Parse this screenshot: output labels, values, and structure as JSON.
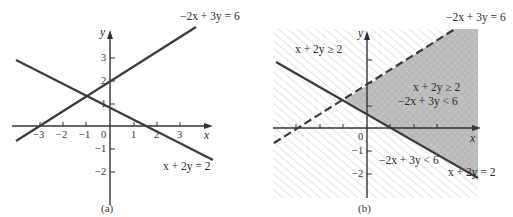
{
  "panels": [
    {
      "id": "a",
      "caption": "(a)",
      "axis_labels": {
        "x": "x",
        "y": "y"
      },
      "x_ticks": [
        "−3",
        "−2",
        "−1",
        "0",
        "1",
        "2",
        "3"
      ],
      "y_ticks": [
        "3",
        "2",
        "1",
        "−1",
        "−2"
      ],
      "lines": [
        {
          "equation": "−2x + 3y = 6",
          "style": "solid"
        },
        {
          "equation": "x + 2y = 2",
          "style": "solid"
        }
      ]
    },
    {
      "id": "b",
      "caption": "(b)",
      "axis_labels": {
        "x": "x",
        "y": "y"
      },
      "x_ticks_labeled": [
        "0"
      ],
      "y_ticks": [
        "−1",
        "−2"
      ],
      "lines": [
        {
          "equation": "−2x + 3y = 6",
          "style": "dashed"
        },
        {
          "equation": "x + 2y = 2",
          "style": "solid"
        }
      ],
      "region_labels": {
        "upper_left": "x + 2y ≥ 2",
        "shaded_line1": "x + 2y ≥ 2",
        "shaded_line2": "−2x + 3y < 6",
        "lower": "−2x + 3y < 6"
      }
    }
  ],
  "colors": {
    "line": "#3a3a3a",
    "shade": "#b9b9b9",
    "hatch": "#e6e6e6"
  }
}
